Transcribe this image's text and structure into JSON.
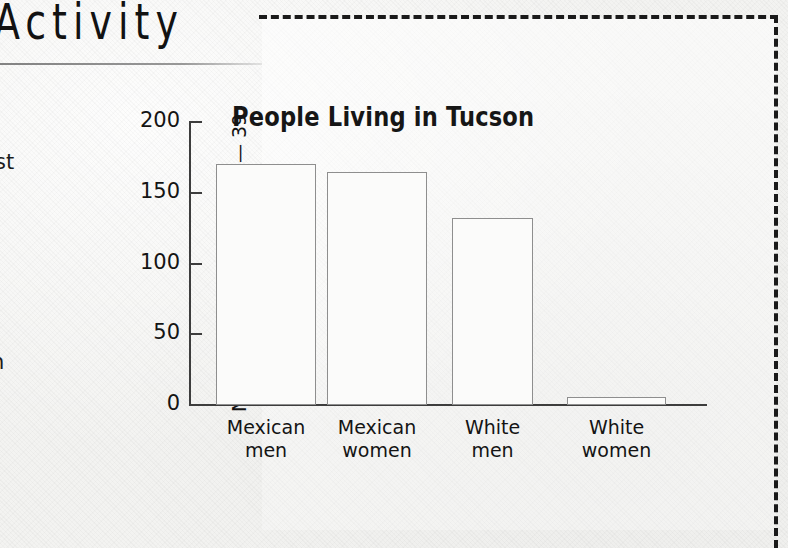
{
  "page": {
    "heading": "Activity",
    "body_fragments": [
      {
        "name": "fragment-st",
        "text": "st"
      },
      {
        "name": "fragment-n",
        "text": "n"
      },
      {
        "name": "fragment-dot",
        "text": ","
      }
    ]
  },
  "chart_data": {
    "type": "bar",
    "title": "People Living in Tucson",
    "xlabel": "",
    "ylabel": "Number of People Age 15 — 39",
    "ylim": [
      0,
      200
    ],
    "yticks": [
      0,
      50,
      100,
      150,
      200
    ],
    "grid": false,
    "legend": "none",
    "categories": [
      "Mexican men",
      "Mexican women",
      "White men",
      "White women"
    ],
    "category_lines": [
      [
        "Mexican",
        "men"
      ],
      [
        "Mexican",
        "women"
      ],
      [
        "White",
        "men"
      ],
      [
        "White",
        "women"
      ]
    ],
    "values": [
      170,
      165,
      132,
      6
    ],
    "bar_fill": "#fbfbfa",
    "bar_edge": "#8e8e8e"
  }
}
